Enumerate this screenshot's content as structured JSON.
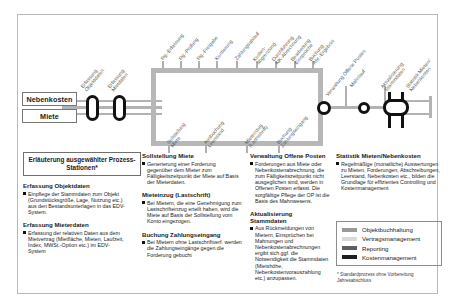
{
  "diagram": {
    "input_boxes": [
      {
        "label": "Nebenkosten"
      },
      {
        "label": "Miete"
      }
    ],
    "entry_stages": [
      {
        "label_line1": "Erfassung",
        "label_line2": "Objektdaten"
      },
      {
        "label_line1": "Erfassung",
        "label_line2": "Mietdaten"
      }
    ],
    "top_steps": [
      {
        "line1": "Rg.-Erfassung",
        "line2": ""
      },
      {
        "line1": "Rg.-Prüfung",
        "line2": ""
      },
      {
        "line1": "Rg.-Freigabe",
        "line2": ""
      },
      {
        "line1": "Kontierung",
        "line2": ""
      },
      {
        "line1": "Zahlungsablauf",
        "line2": ""
      },
      {
        "line1": "Kosten-",
        "line2": "abgrenzung"
      },
      {
        "line1": "Durchführung",
        "line2": "NK-Abrechnung"
      },
      {
        "line1": "Bearbeitung",
        "line2": "Einsprüche"
      },
      {
        "line1": "Buchung",
        "line2": "Abr.-Ergebnis"
      }
    ],
    "bottom_steps": [
      {
        "line1": "Sollstellung",
        "line2": "Miete"
      },
      {
        "line1": "Ausbuchung",
        "line2": "Leerstand"
      },
      {
        "line1": "Mieteinzug",
        "line2": "(Lastschrift)"
      },
      {
        "line1": "Buchung",
        "line2": "Zahlungseingang"
      }
    ],
    "right_steps": [
      {
        "line1": "Verwaltung Offene Posten",
        "line2": ""
      },
      {
        "line1": "Mahnlauf",
        "line2": ""
      },
      {
        "line1": "Aktualisierung",
        "line2": "Stammdaten"
      },
      {
        "line1": "Statistik Mieten/",
        "line2": "Nebenkosten"
      }
    ]
  },
  "legend_title": "Erläuterung ausgewählter Prozess-Stationen*",
  "columns": [
    {
      "blocks": [
        {
          "heading": "Erfassung Objektdaten",
          "text": "Einpflege der Stammdaten zum Objekt (Grundstücksgröße, Lage, Nutzung etc.) aus den Bestandsunterlagen in das EDV-System."
        },
        {
          "heading": "Erfassung Mieterdaten",
          "text": "Erfassung der relativen Daten aus dem Mietvertrag (Mietfläche, Mieten, Laufzeit, Index, MWSt.-Option etc.) im EDV-System"
        }
      ]
    },
    {
      "blocks": [
        {
          "heading": "Sollstellung Miete",
          "text": "Generierung einer Forderung gegenüber dem Mieter zum Fälligkeitszeitpunkt der Miete auf Basis der Mieterdaten."
        },
        {
          "heading": "Mieteinzug (Lastschrift)",
          "text": "Bei Mietern, die eine Genehmigung zum Lastschrifteinzug erteilt haben, wird die Miete auf Basis der Sollstellung vom Konto eingezogen."
        },
        {
          "heading": "Buchung Zahlungseingang",
          "text": "Bei Mietern ohne Lastschriftverf. werden die Zahlungseingänge gegen die Forderung gebucht"
        }
      ]
    },
    {
      "blocks": [
        {
          "heading": "Verwaltung Offene Posten",
          "text": "Forderungen aus Miete oder Nebenkostenabrechnung, die zum Fälligkeitszeitpunkt nicht ausgeglichen sind, werden in Offenen Posten erfasst. Die sorgfältige Pflege der OP ist die Basis des Mahnwesens."
        },
        {
          "heading": "Aktualisierung Stammdaten",
          "text": "Aus Rückmeldungen von Mietern, Einsprüchen bei Mahnungen und Nebenkostenabrechnungen ergibt sich ggf. die Notwendigkeit die Stammdaten (Mietshöhe, Nebenkostenvorauszahlung etc.) anzupassen."
        }
      ]
    },
    {
      "blocks": [
        {
          "heading": "Statistik Mieten/Nebenkosten",
          "text": "Regelmäßige (monatliche) Auswertungen zu Mieten, Forderungen, Abschreibungen, Leerstand, Nebenkosten etc., bilden die Grundlage für effizientes Controlling und Kostenmanagement"
        }
      ]
    }
  ],
  "legend": {
    "items": [
      {
        "label": "Objektbuchhaltung",
        "color": "#9a9a9a"
      },
      {
        "label": "Vertragsmanagement",
        "color": "#d9d9d9"
      },
      {
        "label": "Reporting",
        "color": "#5e5e5e"
      },
      {
        "label": "Kostenmanagement",
        "color": "#1f1f1f"
      }
    ]
  },
  "footnote": "* Standardprozess ohne Vorbereitung Jahresabschluss"
}
